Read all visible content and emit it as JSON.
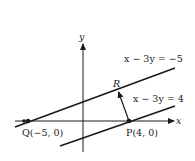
{
  "diagram": {
    "axes": {
      "x_label": "x",
      "y_label": "y"
    },
    "lines": [
      {
        "equation": "x − 3y = −5",
        "id": "upper"
      },
      {
        "equation": "x − 3y = 4",
        "id": "lower"
      }
    ],
    "points": [
      {
        "name": "Q",
        "label": "Q(−5, 0)",
        "x": -5,
        "y": 0
      },
      {
        "name": "P",
        "label": "P(4, 0)",
        "x": 4,
        "y": 0
      },
      {
        "name": "R",
        "label": "R"
      }
    ],
    "colors": {
      "ink": "#1a1a1a",
      "background": "#ffffff"
    }
  }
}
